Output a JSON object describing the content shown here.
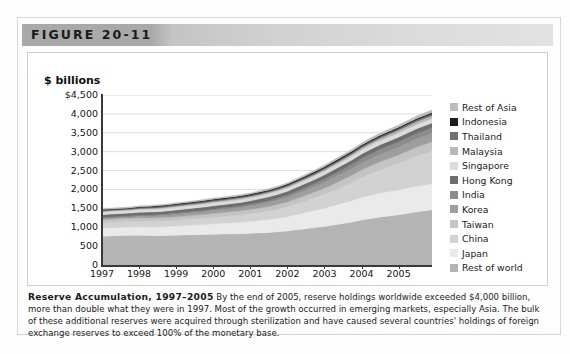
{
  "figure": {
    "banner_label": "FIGURE 20-11"
  },
  "caption": {
    "title": "Reserve Accumulation, 1997–2005",
    "body": "By the end of 2005, reserve holdings worldwide exceeded $4,000 billion, more than double what they were in 1997. Most of the growth occurred in emerging markets, especially Asia. The bulk of these additional reserves were acquired through sterilization and have caused several countries' holdings of foreign exchange reserves to exceed 100% of the monetary base."
  },
  "chart_data": {
    "type": "area",
    "title": "Reserve Accumulation, 1997–2005",
    "xlabel": "",
    "ylabel": "$ billions",
    "ylim": [
      0,
      4500
    ],
    "yticks": [
      "$4,500",
      "4,000",
      "3,500",
      "3,000",
      "2,500",
      "2,000",
      "1,500",
      "1,000",
      "500",
      "0"
    ],
    "ytick_values": [
      4500,
      4000,
      3500,
      3000,
      2500,
      2000,
      1500,
      1000,
      500,
      0
    ],
    "xticks": [
      "1997",
      "1998",
      "1999",
      "2000",
      "2001",
      "2002",
      "2003",
      "2004",
      "2005"
    ],
    "xtick_values": [
      1997,
      1998,
      1999,
      2000,
      2001,
      2002,
      2003,
      2004,
      2005
    ],
    "xlim": [
      1997,
      2005.9
    ],
    "grid": true,
    "grid_axis": "y",
    "stacked": true,
    "stack_order_bottom_to_top": [
      "Rest of world",
      "Japan",
      "China",
      "Taiwan",
      "Korea",
      "India",
      "Hong Kong",
      "Singapore",
      "Malaysia",
      "Thailand",
      "Indonesia",
      "Rest of Asia"
    ],
    "legend_position": "right",
    "x": [
      1997.0,
      1997.25,
      1997.5,
      1997.75,
      1998.0,
      1998.25,
      1998.5,
      1998.75,
      1999.0,
      1999.25,
      1999.5,
      1999.75,
      2000.0,
      2000.25,
      2000.5,
      2000.75,
      2001.0,
      2001.25,
      2001.5,
      2001.75,
      2002.0,
      2002.25,
      2002.5,
      2002.75,
      2003.0,
      2003.25,
      2003.5,
      2003.75,
      2004.0,
      2004.25,
      2004.5,
      2004.75,
      2005.0,
      2005.25,
      2005.5,
      2005.75,
      2005.9
    ],
    "series": [
      {
        "name": "Rest of world",
        "color": "#b4b4b4",
        "values": [
          760,
          770,
          780,
          785,
          790,
          780,
          775,
          780,
          790,
          795,
          800,
          805,
          815,
          820,
          825,
          830,
          840,
          850,
          860,
          880,
          900,
          930,
          960,
          990,
          1020,
          1060,
          1100,
          1140,
          1190,
          1230,
          1270,
          1300,
          1330,
          1370,
          1410,
          1440,
          1460
        ]
      },
      {
        "name": "Japan",
        "color": "#eaeaea",
        "values": [
          215,
          218,
          220,
          222,
          225,
          228,
          232,
          236,
          240,
          248,
          256,
          265,
          275,
          285,
          295,
          305,
          315,
          330,
          345,
          360,
          380,
          405,
          430,
          455,
          480,
          510,
          540,
          570,
          600,
          620,
          635,
          645,
          655,
          665,
          675,
          685,
          690
        ]
      },
      {
        "name": "China",
        "color": "#d2d2d2",
        "values": [
          140,
          142,
          144,
          146,
          148,
          150,
          152,
          154,
          156,
          160,
          164,
          168,
          172,
          178,
          184,
          190,
          200,
          212,
          226,
          242,
          260,
          285,
          310,
          340,
          372,
          405,
          440,
          478,
          520,
          565,
          610,
          655,
          700,
          750,
          800,
          840,
          860
        ]
      },
      {
        "name": "Taiwan",
        "color": "#c4c4c4",
        "values": [
          83,
          84,
          85,
          86,
          88,
          89,
          90,
          91,
          93,
          95,
          97,
          99,
          102,
          104,
          106,
          108,
          112,
          116,
          120,
          125,
          130,
          138,
          146,
          154,
          162,
          172,
          182,
          192,
          202,
          210,
          216,
          222,
          228,
          234,
          240,
          246,
          250
        ]
      },
      {
        "name": "Korea",
        "color": "#9e9e9e",
        "values": [
          34,
          33,
          31,
          30,
          38,
          45,
          52,
          58,
          62,
          66,
          70,
          74,
          78,
          82,
          86,
          90,
          96,
          102,
          108,
          114,
          120,
          128,
          136,
          144,
          152,
          160,
          168,
          176,
          186,
          194,
          200,
          205,
          210,
          214,
          218,
          222,
          225
        ]
      },
      {
        "name": "India",
        "color": "#8c8c8c",
        "values": [
          25,
          26,
          26,
          27,
          27,
          28,
          28,
          29,
          31,
          32,
          33,
          34,
          36,
          37,
          38,
          40,
          42,
          45,
          48,
          52,
          58,
          64,
          72,
          80,
          90,
          98,
          106,
          112,
          120,
          126,
          130,
          134,
          138,
          142,
          145,
          148,
          150
        ]
      },
      {
        "name": "Hong Kong",
        "color": "#6e6e6e",
        "values": [
          75,
          76,
          77,
          78,
          80,
          81,
          82,
          83,
          85,
          86,
          87,
          88,
          90,
          91,
          92,
          93,
          95,
          97,
          99,
          101,
          104,
          106,
          108,
          110,
          113,
          115,
          117,
          119,
          121,
          122,
          123,
          124,
          124,
          124,
          124,
          124,
          124
        ]
      },
      {
        "name": "Singapore",
        "color": "#dcdcdc",
        "values": [
          71,
          72,
          73,
          74,
          75,
          75,
          76,
          76,
          77,
          78,
          78,
          79,
          80,
          80,
          81,
          82,
          83,
          84,
          85,
          86,
          88,
          90,
          92,
          94,
          96,
          99,
          102,
          105,
          108,
          110,
          112,
          113,
          114,
          115,
          116,
          116,
          116
        ]
      },
      {
        "name": "Malaysia",
        "color": "#b8b8b8",
        "values": [
          21,
          20,
          19,
          20,
          21,
          23,
          25,
          26,
          28,
          29,
          30,
          31,
          32,
          32,
          33,
          33,
          33,
          33,
          34,
          34,
          35,
          36,
          37,
          38,
          40,
          42,
          44,
          46,
          50,
          54,
          58,
          62,
          66,
          70,
          72,
          74,
          75
        ]
      },
      {
        "name": "Thailand",
        "color": "#707070",
        "values": [
          27,
          25,
          24,
          26,
          29,
          30,
          31,
          33,
          34,
          34,
          35,
          35,
          35,
          34,
          33,
          33,
          33,
          33,
          34,
          35,
          37,
          38,
          39,
          40,
          41,
          42,
          42,
          43,
          44,
          45,
          46,
          47,
          48,
          49,
          50,
          50,
          51
        ]
      },
      {
        "name": "Indonesia",
        "color": "#1c1c1c",
        "values": [
          18,
          17,
          16,
          17,
          19,
          21,
          23,
          24,
          25,
          26,
          26,
          27,
          28,
          28,
          28,
          28,
          28,
          28,
          29,
          30,
          31,
          32,
          33,
          34,
          35,
          35,
          36,
          36,
          36,
          36,
          35,
          35,
          34,
          34,
          34,
          34,
          34
        ]
      },
      {
        "name": "Rest of Asia",
        "color": "#bdbdbd",
        "values": [
          24,
          24,
          25,
          25,
          26,
          26,
          27,
          27,
          28,
          28,
          29,
          29,
          30,
          30,
          31,
          31,
          32,
          33,
          34,
          35,
          37,
          39,
          41,
          43,
          45,
          47,
          49,
          51,
          54,
          56,
          58,
          60,
          62,
          64,
          66,
          68,
          69
        ]
      }
    ]
  },
  "legend": {
    "items": [
      {
        "label": "Rest of Asia",
        "color": "#bdbdbd"
      },
      {
        "label": "Indonesia",
        "color": "#1c1c1c"
      },
      {
        "label": "Thailand",
        "color": "#707070"
      },
      {
        "label": "Malaysia",
        "color": "#b8b8b8"
      },
      {
        "label": "Singapore",
        "color": "#dcdcdc"
      },
      {
        "label": "Hong Kong",
        "color": "#6e6e6e"
      },
      {
        "label": "India",
        "color": "#8c8c8c"
      },
      {
        "label": "Korea",
        "color": "#9e9e9e"
      },
      {
        "label": "Taiwan",
        "color": "#c4c4c4"
      },
      {
        "label": "China",
        "color": "#d2d2d2"
      },
      {
        "label": "Japan",
        "color": "#eaeaea"
      },
      {
        "label": "Rest of world",
        "color": "#b4b4b4"
      }
    ]
  }
}
